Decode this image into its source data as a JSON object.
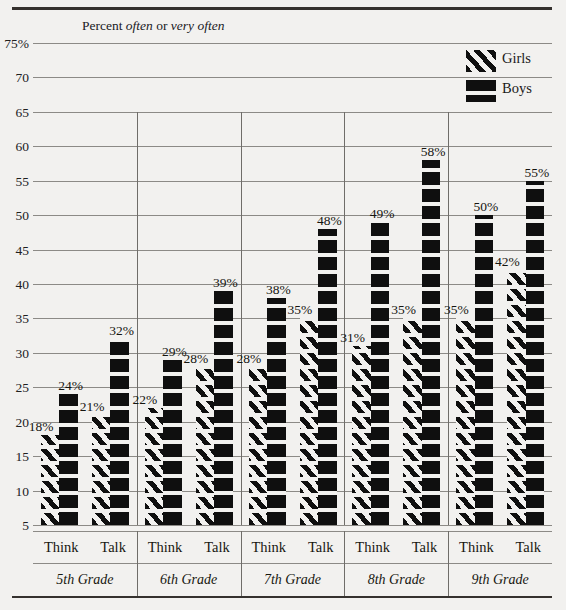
{
  "chart_data": {
    "type": "bar",
    "title": "Percent often or very often",
    "title_parts": {
      "prefix": "Percent ",
      "em1": "often",
      "mid": " or ",
      "em2": "very often"
    },
    "xlabel": "",
    "ylabel": "",
    "ylim": [
      5,
      75
    ],
    "ytick_labels": [
      "75%",
      "70",
      "65",
      "60",
      "55",
      "50",
      "45",
      "40",
      "35",
      "30",
      "25",
      "20",
      "15",
      "10",
      "5"
    ],
    "ytick_values": [
      75,
      70,
      65,
      60,
      55,
      50,
      45,
      40,
      35,
      30,
      25,
      20,
      15,
      10,
      5
    ],
    "grid": true,
    "legend_position": "top-right",
    "groups": [
      "5th Grade",
      "6th Grade",
      "7th Grade",
      "8th Grade",
      "9th Grade"
    ],
    "subcategories": [
      "Think",
      "Talk"
    ],
    "categories": [
      "5th Grade Think",
      "5th Grade Talk",
      "6th Grade Think",
      "6th Grade Talk",
      "7th Grade Think",
      "7th Grade Talk",
      "8th Grade Think",
      "8th Grade Talk",
      "9th Grade Think",
      "9th Grade Talk"
    ],
    "series": [
      {
        "name": "Girls",
        "values": [
          18,
          21,
          22,
          28,
          28,
          35,
          31,
          35,
          35,
          42
        ]
      },
      {
        "name": "Boys",
        "values": [
          24,
          32,
          29,
          39,
          38,
          48,
          49,
          58,
          50,
          55
        ]
      }
    ],
    "data_labels": [
      "18%",
      "24%",
      "21%",
      "32%",
      "22%",
      "29%",
      "28%",
      "39%",
      "28%",
      "38%",
      "35%",
      "48%",
      "31%",
      "49%",
      "35%",
      "58%",
      "35%",
      "50%",
      "42%",
      "55%"
    ],
    "colors": {
      "girls": "#0f0f0f",
      "boys": "#0f0f0f",
      "background": "#f2f1ef",
      "grid": "#8c8a86",
      "rule": "#35312e"
    }
  },
  "legend": {
    "items": [
      {
        "label": "Girls",
        "swatch": "diagonal-hatch-swatch"
      },
      {
        "label": "Boys",
        "swatch": "solid-black-swatch"
      }
    ]
  },
  "axis": {
    "title_full": "Percent often or very often",
    "ticks": [
      "75%",
      "70",
      "65",
      "60",
      "55",
      "50",
      "45",
      "40",
      "35",
      "30",
      "25",
      "20",
      "15",
      "10",
      "5"
    ]
  },
  "xaxis": {
    "groups": [
      {
        "name": "5th Grade",
        "bars": [
          "Think",
          "Talk"
        ]
      },
      {
        "name": "6th Grade",
        "bars": [
          "Think",
          "Talk"
        ]
      },
      {
        "name": "7th Grade",
        "bars": [
          "Think",
          "Talk"
        ]
      },
      {
        "name": "8th Grade",
        "bars": [
          "Think",
          "Talk"
        ]
      },
      {
        "name": "9th Grade",
        "bars": [
          "Think",
          "Talk"
        ]
      }
    ]
  }
}
